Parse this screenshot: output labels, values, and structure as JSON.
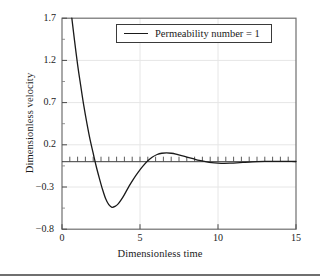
{
  "chart_data": {
    "type": "line",
    "title": "",
    "xlabel": "Dimensionless time",
    "ylabel": "Dimensionless velocity",
    "xlim": [
      0,
      15
    ],
    "ylim": [
      -0.8,
      1.7
    ],
    "xticks": [
      0,
      5,
      10,
      15
    ],
    "xtick_labels": [
      "0",
      "5",
      "10",
      "15"
    ],
    "yticks": [
      1.7,
      1.2,
      0.7,
      0.2,
      -0.3,
      -0.8
    ],
    "ytick_labels": [
      "1.7",
      "1.2",
      "0.7",
      "0.2",
      "−0.3",
      "−0.8"
    ],
    "xminor_step": 0.5,
    "grid": true,
    "grid_color": "#e3e3e3",
    "zero_line": true,
    "legend_position": "upper center",
    "series": [
      {
        "name": "Permeability number = 1",
        "color": "#1a1a1a",
        "x": [
          0.63,
          0.8,
          1.0,
          1.2,
          1.4,
          1.6,
          1.8,
          2.0,
          2.2,
          2.4,
          2.6,
          2.8,
          3.0,
          3.2,
          3.4,
          3.6,
          3.8,
          4.0,
          4.3,
          4.6,
          4.9,
          5.2,
          5.5,
          5.8,
          6.1,
          6.4,
          6.7,
          7.0,
          7.3,
          7.6,
          8.0,
          8.4,
          8.8,
          9.2,
          9.6,
          10.0,
          10.4,
          10.8,
          11.2,
          11.6,
          12.0,
          12.5,
          13.0,
          13.5,
          14.0,
          14.5,
          15.0
        ],
        "y": [
          1.7,
          1.44,
          1.15,
          0.9,
          0.66,
          0.45,
          0.26,
          0.1,
          -0.06,
          -0.2,
          -0.33,
          -0.44,
          -0.51,
          -0.54,
          -0.53,
          -0.5,
          -0.45,
          -0.39,
          -0.29,
          -0.2,
          -0.12,
          -0.05,
          0.01,
          0.055,
          0.085,
          0.1,
          0.105,
          0.1,
          0.09,
          0.075,
          0.055,
          0.035,
          0.015,
          0.0,
          -0.012,
          -0.018,
          -0.02,
          -0.018,
          -0.014,
          -0.009,
          -0.005,
          0.0,
          0.003,
          0.004,
          0.004,
          0.003,
          0.002
        ]
      }
    ],
    "legend": [
      {
        "label": "Permeability number = 1"
      }
    ]
  },
  "legend": {
    "label": "Permeability number = 1"
  },
  "axes": {
    "x_title": "Dimensionless time",
    "y_title": "Dimensionless velocity",
    "x_tick_0": "0",
    "x_tick_1": "5",
    "x_tick_2": "10",
    "x_tick_3": "15",
    "y_tick_0": "1.7",
    "y_tick_1": "1.2",
    "y_tick_2": "0.7",
    "y_tick_3": "0.2",
    "y_tick_4": "−0.3",
    "y_tick_5": "−0.8"
  },
  "colors": {
    "curve": "#1a1a1a",
    "frame": "#6f6f6f",
    "grid": "#e3e3e3",
    "text": "#1a1a1a",
    "background": "#ffffff"
  }
}
